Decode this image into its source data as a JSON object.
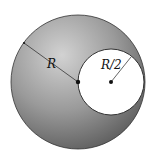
{
  "diagram": {
    "labels": {
      "big_radius": "R",
      "small_radius": "R/2"
    },
    "colors": {
      "sphere_dark": "#6a6a6a",
      "sphere_light": "#c8c8c8",
      "cavity": "#ffffff",
      "outline": "#222222"
    },
    "geometry": {
      "sphere": {
        "cx": 78,
        "cy": 82,
        "r": 67
      },
      "cavity": {
        "cx": 111,
        "cy": 82,
        "r": 33
      }
    }
  }
}
